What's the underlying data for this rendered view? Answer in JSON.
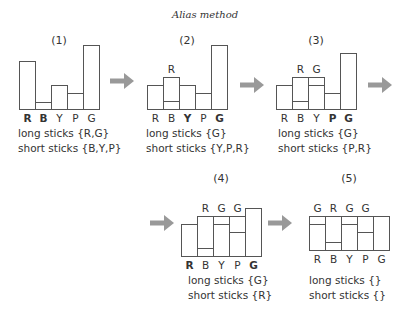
{
  "title": "Alias method",
  "colors": {
    "stroke": "#555555",
    "text": "#333333",
    "arrow": "#999999",
    "background": "#ffffff"
  },
  "panels": [
    {
      "id": "1",
      "label": "(1)",
      "x": 19,
      "baseline": 109,
      "bar_width": 16,
      "bars": [
        {
          "name": "R",
          "bold": true,
          "height": 48,
          "split": null,
          "top_label": ""
        },
        {
          "name": "B",
          "bold": true,
          "height": 7,
          "split": null,
          "top_label": ""
        },
        {
          "name": "Y",
          "bold": false,
          "height": 24,
          "split": null,
          "top_label": ""
        },
        {
          "name": "P",
          "bold": false,
          "height": 16,
          "split": null,
          "top_label": ""
        },
        {
          "name": "G",
          "bold": false,
          "height": 64,
          "split": null,
          "top_label": ""
        }
      ],
      "long_sticks": "long sticks {R,G}",
      "short_sticks": "short sticks {B,Y,P}",
      "caption_x": 18,
      "caption_y": 126,
      "label_x": 59,
      "label_y": 44
    },
    {
      "id": "2",
      "label": "(2)",
      "x": 147,
      "baseline": 109,
      "bar_width": 16,
      "bars": [
        {
          "name": "R",
          "bold": false,
          "height": 24,
          "split": null,
          "top_label": ""
        },
        {
          "name": "B",
          "bold": false,
          "height": 32,
          "split": 8,
          "top_label": "R"
        },
        {
          "name": "Y",
          "bold": true,
          "height": 24,
          "split": null,
          "top_label": ""
        },
        {
          "name": "P",
          "bold": false,
          "height": 16,
          "split": null,
          "top_label": ""
        },
        {
          "name": "G",
          "bold": true,
          "height": 64,
          "split": null,
          "top_label": ""
        }
      ],
      "long_sticks": "long sticks {G}",
      "short_sticks": "short sticks {Y,P,R}",
      "caption_x": 146,
      "caption_y": 126,
      "label_x": 187,
      "label_y": 44
    },
    {
      "id": "3",
      "label": "(3)",
      "x": 276,
      "baseline": 109,
      "bar_width": 16,
      "bars": [
        {
          "name": "R",
          "bold": false,
          "height": 24,
          "split": null,
          "top_label": ""
        },
        {
          "name": "B",
          "bold": false,
          "height": 32,
          "split": 8,
          "top_label": "R"
        },
        {
          "name": "Y",
          "bold": false,
          "height": 32,
          "split": 24,
          "top_label": "G"
        },
        {
          "name": "P",
          "bold": true,
          "height": 16,
          "split": null,
          "top_label": ""
        },
        {
          "name": "G",
          "bold": true,
          "height": 56,
          "split": null,
          "top_label": ""
        }
      ],
      "long_sticks": "long sticks {G}",
      "short_sticks": "short sticks {P,R}",
      "caption_x": 278,
      "caption_y": 126,
      "label_x": 316,
      "label_y": 44
    },
    {
      "id": "4",
      "label": "(4)",
      "x": 181,
      "baseline": 256,
      "bar_width": 16,
      "bars": [
        {
          "name": "R",
          "bold": true,
          "height": 32,
          "split": null,
          "top_label": ""
        },
        {
          "name": "B",
          "bold": false,
          "height": 40,
          "split": 8,
          "top_label": "R"
        },
        {
          "name": "Y",
          "bold": false,
          "height": 40,
          "split": 32,
          "top_label": "G"
        },
        {
          "name": "P",
          "bold": false,
          "height": 40,
          "split": 24,
          "top_label": "G"
        },
        {
          "name": "G",
          "bold": true,
          "height": 48,
          "split": null,
          "top_label": ""
        }
      ],
      "long_sticks": "long sticks {G}",
      "short_sticks": "short sticks {R}",
      "caption_x": 188,
      "caption_y": 273,
      "label_x": 221,
      "label_y": 182
    },
    {
      "id": "5",
      "label": "(5)",
      "x": 309,
      "baseline": 250,
      "bar_width": 16,
      "bars": [
        {
          "name": "R",
          "bold": false,
          "height": 34,
          "split": 26,
          "top_label": "G"
        },
        {
          "name": "B",
          "bold": false,
          "height": 34,
          "split": 8,
          "top_label": "R"
        },
        {
          "name": "Y",
          "bold": false,
          "height": 34,
          "split": 26,
          "top_label": "G"
        },
        {
          "name": "P",
          "bold": false,
          "height": 34,
          "split": 18,
          "top_label": "G"
        },
        {
          "name": "G",
          "bold": false,
          "height": 34,
          "split": null,
          "top_label": ""
        }
      ],
      "long_sticks": "long sticks {}",
      "short_sticks": "short sticks {}",
      "caption_x": 309,
      "caption_y": 273,
      "label_x": 349,
      "label_y": 182
    }
  ],
  "arrows": [
    {
      "id": "arrow-1-2",
      "x": 110,
      "y": 81,
      "length": 24
    },
    {
      "id": "arrow-2-3",
      "x": 240,
      "y": 85,
      "length": 24
    },
    {
      "id": "arrow-3-4",
      "x": 368,
      "y": 85,
      "length": 24
    },
    {
      "id": "arrow-to-4",
      "x": 150,
      "y": 223,
      "length": 24
    },
    {
      "id": "arrow-4-5",
      "x": 268,
      "y": 223,
      "length": 24
    }
  ]
}
